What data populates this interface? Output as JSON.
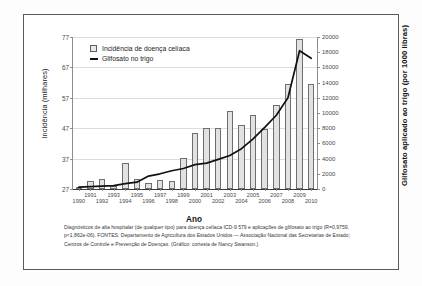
{
  "figure": {
    "axis_title_left": "Incidência (milhares)",
    "axis_title_right": "Glifosato aplicado ao trigo (por 1000 libras)",
    "axis_title_bottom": "Ano",
    "legend": [
      {
        "label": "Incidência de doença celíaca",
        "marker": "bar-swatch",
        "color": "#e2e2e2"
      },
      {
        "label": "Glifosato no trigo",
        "marker": "line-swatch",
        "color": "#111111"
      }
    ],
    "caption": "Diagnósticos de alta hospitalar (de qualquer tipo) para doença celíaca ICD-9 579 e aplicações de glifosato ao trigo (R=0,9759, p<1,862e-06).\nFONTES: Departamento de Agricultura dos Estados Unidos — Associação Nacional das Secretarias de Estado; Centros de Controle e Prevenção de Doenças. (Gráfico: cortesia de Nancy Swanson.)"
  },
  "chart_data": {
    "type": "bar",
    "title": "",
    "xlabel": "Ano",
    "ylabel": "Incidência (milhares)",
    "y2label": "Glifosato aplicado ao trigo (por 1000 libras)",
    "grid": true,
    "legend_position": "top-left",
    "categories": [
      "1990",
      "1991",
      "1992",
      "1993",
      "1994",
      "1995",
      "1996",
      "1997",
      "1998",
      "1999",
      "2000",
      "2001",
      "2002",
      "2003",
      "2004",
      "2005",
      "2006",
      "2007",
      "2008",
      "2009",
      "2010"
    ],
    "ylim": [
      27,
      77
    ],
    "yticks": [
      27,
      37,
      47,
      57,
      67,
      77
    ],
    "y2lim": [
      0,
      20000
    ],
    "y2ticks": [
      0,
      2000,
      4000,
      6000,
      8000,
      10000,
      12000,
      14000,
      16000,
      18000,
      20000
    ],
    "series": [
      {
        "name": "Incidência de doença celíaca",
        "type": "bar",
        "axis": "left",
        "units": "milhares",
        "color": "#e2e2e2",
        "edge_color": "#6e6e6e",
        "values": [
          27.6,
          29.6,
          30.4,
          27.9,
          35.5,
          30.2,
          29.0,
          30.0,
          29.7,
          37.1,
          45.5,
          47.0,
          47.0,
          52.5,
          48.2,
          51.5,
          46.6,
          54.5,
          61.5,
          76.5,
          61.5
        ]
      },
      {
        "name": "Glifosato no trigo",
        "type": "line",
        "axis": "right",
        "units": "por 1000 libras",
        "color": "#111111",
        "values": [
          250,
          300,
          380,
          450,
          700,
          900,
          1700,
          2000,
          2400,
          2700,
          3200,
          3400,
          3900,
          4400,
          5300,
          6600,
          8100,
          9700,
          12000,
          18200,
          17200
        ]
      }
    ]
  }
}
